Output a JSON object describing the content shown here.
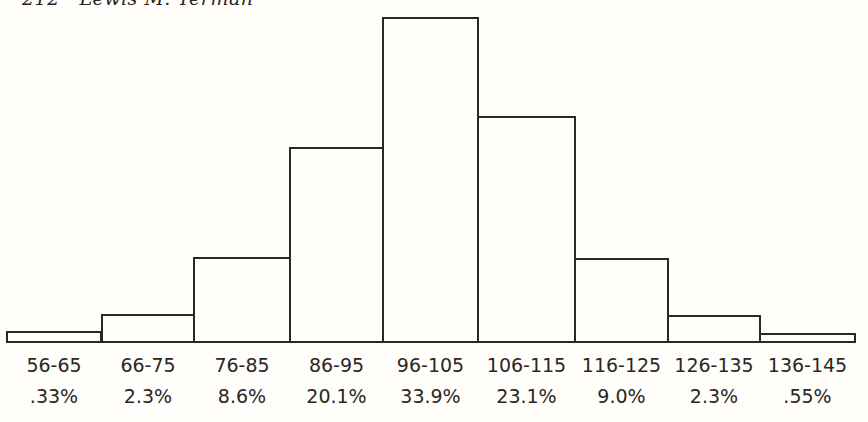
{
  "page": {
    "running_head": "212   Lewis M. Terman"
  },
  "chart_data": {
    "type": "bar",
    "title": "",
    "xlabel": "",
    "ylabel": "",
    "categories": [
      "56-65",
      "66-75",
      "76-85",
      "86-95",
      "96-105",
      "106-115",
      "116-125",
      "126-135",
      "136-145"
    ],
    "values": [
      0.33,
      2.3,
      8.6,
      20.1,
      33.9,
      23.1,
      9.0,
      2.3,
      0.55
    ],
    "value_labels": [
      ".33%",
      "2.3%",
      "8.6%",
      "20.1%",
      "33.9%",
      "23.1%",
      "9.0%",
      "2.3%",
      ".55%"
    ],
    "ylim": [
      0,
      34
    ],
    "grid": false,
    "legend": null,
    "bar_style": {
      "fill": "#fffefa",
      "stroke": "#2a2724"
    }
  },
  "bars": [
    {
      "range": "56-65",
      "pct": ".33%",
      "x": 6,
      "w": 96,
      "top": 331
    },
    {
      "range": "66-75",
      "pct": "2.3%",
      "x": 101,
      "w": 94,
      "top": 314
    },
    {
      "range": "76-85",
      "pct": "8.6%",
      "x": 193,
      "w": 98,
      "top": 257
    },
    {
      "range": "86-95",
      "pct": "20.1%",
      "x": 289,
      "w": 95,
      "top": 147
    },
    {
      "range": "96-105",
      "pct": "33.9%",
      "x": 382,
      "w": 97,
      "top": 17
    },
    {
      "range": "106-115",
      "pct": "23.1%",
      "x": 477,
      "w": 99,
      "top": 116
    },
    {
      "range": "116-125",
      "pct": "9.0%",
      "x": 574,
      "w": 95,
      "top": 258
    },
    {
      "range": "126-135",
      "pct": "2.3%",
      "x": 667,
      "w": 94,
      "top": 315
    },
    {
      "range": "136-145",
      "pct": ".55%",
      "x": 759,
      "w": 97,
      "top": 333
    }
  ]
}
